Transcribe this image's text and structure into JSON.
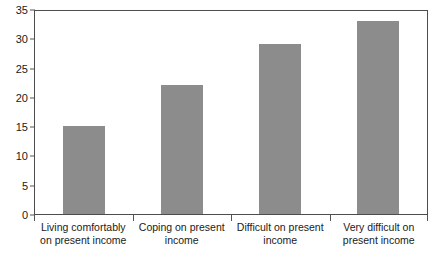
{
  "chart_data": {
    "type": "bar",
    "title": "",
    "subtitle": "",
    "xlabel": "",
    "ylabel": "",
    "categories": [
      "Living comfortably on present income",
      "Coping on present income",
      "Difficult on present income",
      "Very difficult on present income"
    ],
    "category_lines": [
      [
        "Living comfortably",
        "on present income"
      ],
      [
        "Coping on present",
        "income"
      ],
      [
        "Difficult on present",
        "income"
      ],
      [
        "Very difficult on",
        "present income"
      ]
    ],
    "values": [
      15,
      22,
      29,
      33
    ],
    "ylim": [
      0,
      35
    ],
    "ytick_values": [
      0,
      5,
      10,
      15,
      20,
      25,
      30,
      35
    ],
    "ytick_labels": [
      "0",
      "5",
      "10",
      "15",
      "20",
      "25",
      "30",
      "35"
    ],
    "grid": false,
    "legend": false,
    "legend_position": "none",
    "bar_color": "#8c8c8c",
    "axis_color": "#4d4d4d",
    "text_color": "#1a1a1a",
    "background_color": "#ffffff"
  }
}
